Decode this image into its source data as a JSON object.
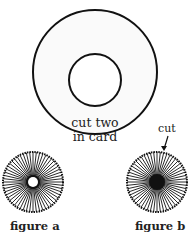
{
  "diagram": {
    "card": {
      "label_line1": "cut two",
      "label_line2": "in card"
    },
    "figure_a": {
      "caption": "figure a"
    },
    "figure_b": {
      "caption": "figure b",
      "annotation": "cut"
    }
  },
  "colors": {
    "stroke": "#111111",
    "background": "#ffffff",
    "text": "#222222"
  }
}
